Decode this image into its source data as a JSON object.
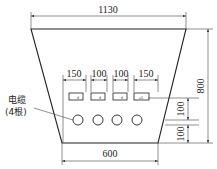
{
  "diagram": {
    "type": "cable trench cross-section",
    "dimensions": {
      "top_width": "1130",
      "bottom_width": "600",
      "height": "800",
      "spacings": [
        "150",
        "100",
        "100",
        "150"
      ],
      "vertical_spacings": [
        "100",
        "100"
      ]
    },
    "box_labels": [
      "d",
      "d",
      "d",
      "≥5"
    ],
    "cable_label_line1": "电缆",
    "cable_label_line2": "(4根)",
    "cable_count": 4
  }
}
